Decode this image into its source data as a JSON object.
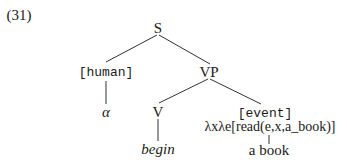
{
  "example_number": "(31)",
  "tree": {
    "root": {
      "label": "S"
    },
    "subject": {
      "feature": "[human]",
      "leaf": "α"
    },
    "vp": {
      "label": "VP"
    },
    "verb": {
      "label": "V",
      "leaf": "begin"
    },
    "complement": {
      "feature": "[event]",
      "semantics": "λxλe[read(e,x,a_book)]",
      "leaf": "a book"
    }
  },
  "colors": {
    "text": "#1a1a1a",
    "edges": "#333333",
    "background": "#ffffff"
  }
}
